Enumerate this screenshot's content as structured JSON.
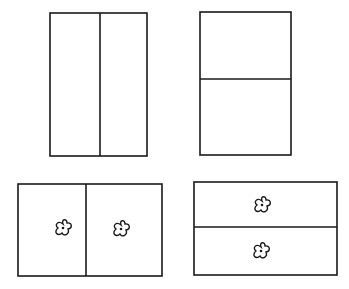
{
  "diagram": {
    "stroke_color": "#1a1a1a",
    "background": "#ffffff",
    "panels": [
      {
        "id": "top-left",
        "rect": {
          "x": 50,
          "y": 13,
          "w": 97,
          "h": 143
        },
        "division": "vertical",
        "divider_pos": 100,
        "motifs": []
      },
      {
        "id": "top-right",
        "rect": {
          "x": 200,
          "y": 12,
          "w": 91,
          "h": 143
        },
        "division": "horizontal",
        "divider_pos": 79,
        "motifs": []
      },
      {
        "id": "bottom-left",
        "rect": {
          "x": 18,
          "y": 184,
          "w": 144,
          "h": 92
        },
        "division": "vertical",
        "divider_pos": 86,
        "motifs": [
          {
            "type": "clover",
            "cx": 63,
            "cy": 228
          },
          {
            "type": "clover",
            "cx": 121,
            "cy": 229
          }
        ]
      },
      {
        "id": "bottom-right",
        "rect": {
          "x": 194,
          "y": 182,
          "w": 143,
          "h": 93
        },
        "division": "horizontal",
        "divider_pos": 227,
        "motifs": [
          {
            "type": "clover",
            "cx": 262,
            "cy": 205
          },
          {
            "type": "clover",
            "cx": 261,
            "cy": 251
          }
        ]
      }
    ]
  }
}
